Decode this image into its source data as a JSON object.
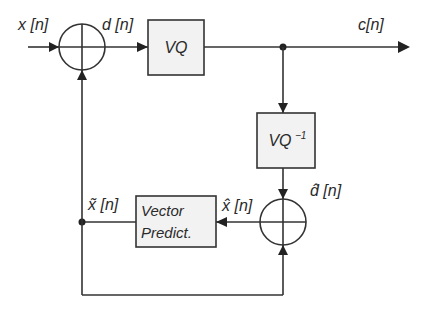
{
  "diagram": {
    "type": "block-diagram",
    "title": "",
    "signals": {
      "input": "x [n]",
      "difference": "d [n]",
      "output": "c[n]",
      "recon_difference": "d̂ [n]",
      "recon_signal": "x̂ [n]",
      "prediction": "x̃ [n]"
    },
    "blocks": {
      "vq": "VQ",
      "vq_inverse": "VQ",
      "vq_inverse_sup": "−1",
      "predictor_line1": "Vector",
      "predictor_line2": "Predict."
    },
    "summers": [
      {
        "id": "sum-encoder",
        "inputs": [
          "x[n]",
          "x̃[n]"
        ],
        "output": "d[n]"
      },
      {
        "id": "sum-decoder",
        "inputs": [
          "d̂[n]",
          "x̃[n]"
        ],
        "output": "x̂[n]"
      }
    ],
    "colors": {
      "stroke": "#333333",
      "box_fill": "#f2f2f2",
      "background": "#ffffff"
    }
  }
}
